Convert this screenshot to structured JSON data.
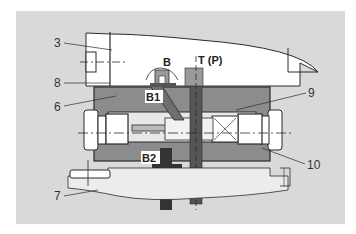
{
  "diagram": {
    "type": "hydraulic-valve-cross-section",
    "colors": {
      "background_panel": "#d9d9d9",
      "housing_fill": "#8c8c8c",
      "outline": "#2b2b2b",
      "white_parts": "#ffffff",
      "label_bg": "#ffffff"
    },
    "labels": {
      "part_3": "3",
      "part_8": "8",
      "part_6": "6",
      "part_7": "7",
      "part_9": "9",
      "part_10": "10",
      "port_b": "B",
      "port_t_p": "T (P)",
      "port_b1": "B1",
      "port_b2": "B2"
    }
  }
}
